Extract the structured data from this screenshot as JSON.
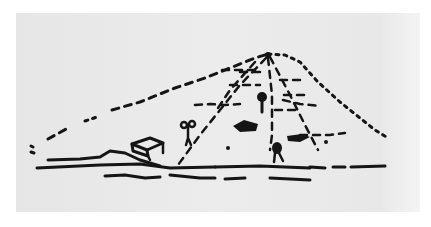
{
  "image": {
    "description": "Hand-drawn ink sketch of a hill / mound with dashed path lines converging at the summit, small figures and benches",
    "background_color": "#ffffff",
    "paper_color": "#e8e8e8",
    "ink_color": "#151515",
    "elements": [
      "hill-outline",
      "summit",
      "path-lines",
      "bench-left",
      "bench-center",
      "bench-right",
      "person-left",
      "person-center",
      "person-right",
      "ground-lines"
    ]
  }
}
